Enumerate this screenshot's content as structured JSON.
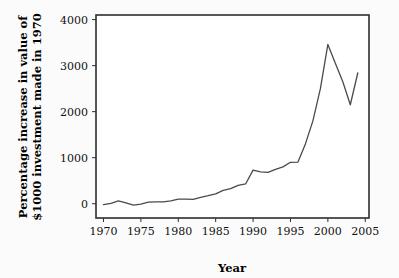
{
  "chart_data": {
    "type": "line",
    "title": "",
    "xlabel": "Year",
    "ylabel": "Percentage increase in value of $1000 investment made in 1970",
    "ylabel_line1": "Percentage increase in value of",
    "ylabel_line2": "$1000 investment made in 1970",
    "xlim": [
      1969,
      2005.5
    ],
    "ylim": [
      -310,
      4100
    ],
    "xticks": [
      1970,
      1975,
      1980,
      1985,
      1990,
      1995,
      2000,
      2005
    ],
    "xtick_labels": [
      "1970",
      "1975",
      "1980",
      "1985",
      "1990",
      "1995",
      "2000",
      "2005"
    ],
    "yticks": [
      0,
      1000,
      2000,
      3000,
      4000
    ],
    "ytick_labels": [
      "0",
      "1000",
      "2000",
      "3000",
      "4000"
    ],
    "grid": false,
    "legend": "none",
    "line_color": "#4a4a4a",
    "x": [
      1970,
      1971,
      1972,
      1973,
      1974,
      1975,
      1976,
      1977,
      1978,
      1979,
      1980,
      1981,
      1982,
      1983,
      1984,
      1985,
      1986,
      1987,
      1988,
      1989,
      1990,
      1991,
      1992,
      1993,
      1994,
      1995,
      1996,
      1997,
      1998,
      1999,
      2000,
      2001,
      2002,
      2003,
      2004
    ],
    "values": [
      -20,
      10,
      60,
      20,
      -30,
      -10,
      35,
      40,
      40,
      60,
      100,
      100,
      95,
      140,
      175,
      215,
      290,
      330,
      400,
      430,
      730,
      690,
      680,
      745,
      800,
      900,
      905,
      1300,
      1800,
      2500,
      3460,
      3050,
      2650,
      2150,
      2840
    ]
  },
  "figure": {
    "background_color": "#fbfbfb",
    "plot_background_color": "#ffffff",
    "frame_color": "#2e2e2e"
  }
}
